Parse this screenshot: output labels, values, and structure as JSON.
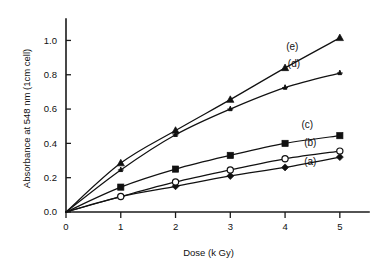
{
  "chart_data": {
    "type": "line",
    "title": "",
    "subtitle": "",
    "xlabel": "Dose (k Gy)",
    "ylabel": "Absorbance at 548 nm (1cm cell)",
    "x": [
      0,
      1,
      2,
      3,
      4,
      5
    ],
    "xlim": [
      0,
      5.35
    ],
    "ylim": [
      0,
      1.09
    ],
    "xticks": [
      0,
      1,
      2,
      3,
      4,
      5
    ],
    "xticklabels": [
      "0",
      "1",
      "2",
      "3",
      "4",
      "5"
    ],
    "yticks": [
      0.0,
      0.2,
      0.4,
      0.6,
      0.8,
      1.0
    ],
    "yticklabels": [
      "0.0",
      "0.2",
      "0.4",
      "0.6",
      "0.8",
      "1.0"
    ],
    "grid": false,
    "legend_position": "inline-right-of-curves",
    "series": [
      {
        "name": "(a)",
        "marker": "filled-diamond",
        "color": "#111111",
        "values": [
          0,
          0.09,
          0.15,
          0.21,
          0.26,
          0.32
        ],
        "label_x": 4.35,
        "label_y": 0.275
      },
      {
        "name": "(b)",
        "marker": "open-circle",
        "color": "#111111",
        "values": [
          0,
          0.09,
          0.175,
          0.245,
          0.31,
          0.355
        ],
        "label_x": 4.35,
        "label_y": 0.385
      },
      {
        "name": "(c)",
        "marker": "filled-square",
        "color": "#111111",
        "values": [
          0,
          0.145,
          0.25,
          0.33,
          0.4,
          0.445
        ],
        "label_x": 4.3,
        "label_y": 0.49
      },
      {
        "name": "(d)",
        "marker": "star",
        "color": "#111111",
        "values": [
          0,
          0.245,
          0.45,
          0.6,
          0.725,
          0.81
        ],
        "label_x": 4.05,
        "label_y": 0.845
      },
      {
        "name": "(e)",
        "marker": "filled-triangle",
        "color": "#111111",
        "values": [
          0,
          0.285,
          0.475,
          0.655,
          0.84,
          1.015
        ],
        "label_x": 4.02,
        "label_y": 0.945
      }
    ]
  },
  "axes": {
    "x_axis_title": "Dose (k Gy)",
    "y_axis_title": "Absorbance at 548 nm (1cm cell)"
  }
}
